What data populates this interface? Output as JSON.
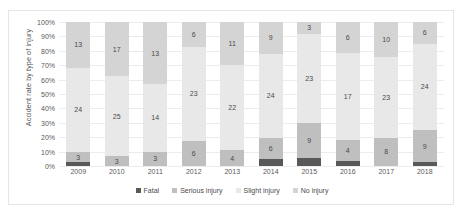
{
  "chart_data": {
    "type": "bar",
    "subtype": "stacked-100-percent",
    "title": "",
    "xlabel": "",
    "ylabel": "Accident rate by type of injury",
    "ylim": [
      0,
      100
    ],
    "ytick_labels": [
      "0%",
      "10%",
      "20%",
      "30%",
      "40%",
      "50%",
      "60%",
      "70%",
      "80%",
      "90%",
      "100%"
    ],
    "ytick_values": [
      0,
      10,
      20,
      30,
      40,
      50,
      60,
      70,
      80,
      90,
      100
    ],
    "grid": true,
    "legend_position": "bottom",
    "categories": [
      "2009",
      "2010",
      "2011",
      "2012",
      "2013",
      "2014",
      "2015",
      "2016",
      "2017",
      "2018"
    ],
    "series": [
      {
        "name": "Fatal",
        "color": "#595959",
        "values": [
          1,
          0,
          0,
          0,
          0,
          2,
          2,
          1,
          0,
          1
        ]
      },
      {
        "name": "Serious injury",
        "color": "#bfbfbf",
        "values": [
          3,
          3,
          3,
          6,
          4,
          6,
          9,
          4,
          8,
          9
        ]
      },
      {
        "name": "Slight injury",
        "color": "#e8e8e8",
        "values": [
          24,
          25,
          14,
          23,
          22,
          24,
          23,
          17,
          23,
          24
        ]
      },
      {
        "name": "No injury",
        "color": "#d4d4d4",
        "values": [
          13,
          17,
          13,
          6,
          11,
          9,
          3,
          6,
          10,
          6
        ]
      }
    ],
    "data_labels": {
      "Fatal": [
        "",
        "",
        "",
        "",
        "",
        "",
        "",
        "",
        "",
        ""
      ],
      "Serious injury": [
        "3",
        "3",
        "3",
        "6",
        "4",
        "6",
        "9",
        "4",
        "8",
        "9"
      ],
      "Slight injury": [
        "24",
        "25",
        "14",
        "23",
        "22",
        "24",
        "23",
        "17",
        "23",
        "24"
      ],
      "No injury": [
        "13",
        "17",
        "13",
        "6",
        "11",
        "9",
        "3",
        "6",
        "10",
        "6"
      ]
    }
  },
  "legend": {
    "items": [
      {
        "label": "Fatal",
        "color": "#595959"
      },
      {
        "label": "Serious injury",
        "color": "#bfbfbf"
      },
      {
        "label": "Slight injury",
        "color": "#e8e8e8"
      },
      {
        "label": "No injury",
        "color": "#d4d4d4"
      }
    ]
  }
}
